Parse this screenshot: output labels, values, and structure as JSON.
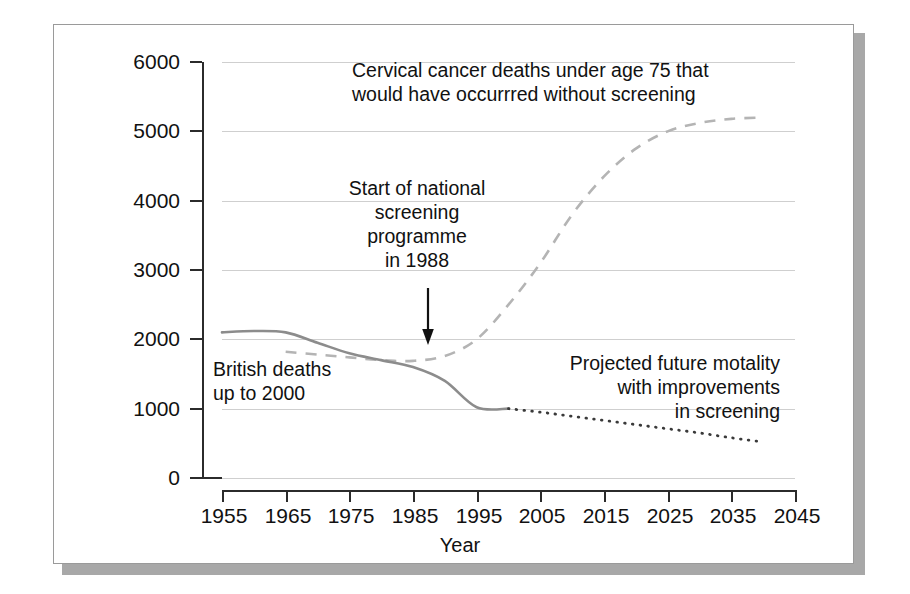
{
  "figure": {
    "background_color": "#ffffff",
    "frame_border_color": "#9a9a9a",
    "shadow_color": "#a8a8a8"
  },
  "chart_data": {
    "type": "line",
    "title": "",
    "xlabel": "Year",
    "ylabel": "Annual deaths",
    "xlim": [
      1955,
      2045
    ],
    "ylim": [
      0,
      6000
    ],
    "grid": true,
    "legend_position": "none",
    "x_ticks": [
      "1955",
      "1965",
      "1975",
      "1985",
      "1995",
      "2005",
      "2015",
      "2025",
      "2035",
      "2045"
    ],
    "y_ticks": [
      "0",
      "1000",
      "2000",
      "3000",
      "4000",
      "5000",
      "6000"
    ],
    "series": [
      {
        "name": "British deaths up to 2000",
        "style": "solid",
        "color": "#8c8c8c",
        "x": [
          1955,
          1960,
          1965,
          1970,
          1975,
          1980,
          1985,
          1990,
          1995,
          2000
        ],
        "values": [
          2100,
          2120,
          2100,
          1950,
          1800,
          1700,
          1600,
          1400,
          1020,
          1000
        ]
      },
      {
        "name": "Cervical cancer deaths under age 75 that would have occurrred without screening",
        "style": "dashed",
        "color": "#b4b4b4",
        "x": [
          1965,
          1970,
          1975,
          1980,
          1985,
          1990,
          1995,
          2000,
          2005,
          2010,
          2015,
          2020,
          2025,
          2030,
          2035,
          2040
        ],
        "values": [
          1820,
          1780,
          1740,
          1700,
          1690,
          1760,
          2000,
          2500,
          3100,
          3800,
          4350,
          4750,
          5000,
          5120,
          5180,
          5200
        ]
      },
      {
        "name": "Projected future motality with improvements in screening",
        "style": "dotted",
        "color": "#3a3a3a",
        "x": [
          2000,
          2005,
          2010,
          2015,
          2020,
          2025,
          2030,
          2035,
          2040
        ],
        "values": [
          1000,
          950,
          890,
          830,
          770,
          710,
          650,
          580,
          520
        ]
      }
    ],
    "annotations": [
      {
        "id": "headline",
        "text": "Cervical cancer deaths under age 75 that\nwould have occurrred without screening",
        "align": "left"
      },
      {
        "id": "screening-start",
        "text": "Start of national\nscreening\nprogramme\nin 1988",
        "align": "center",
        "marker": "down-arrow-at-1988"
      },
      {
        "id": "british-deaths",
        "text": "British deaths\nup to 2000",
        "align": "left"
      },
      {
        "id": "projected-future",
        "text": "Projected future motality\nwith improvements\nin screening",
        "align": "right"
      }
    ]
  },
  "axes": {
    "y_title": "Annual deaths",
    "x_title": "Year",
    "y_tick_labels": [
      "6000",
      "5000",
      "4000",
      "3000",
      "2000",
      "1000",
      "0"
    ],
    "x_tick_labels": [
      "1955",
      "1965",
      "1975",
      "1985",
      "1995",
      "2005",
      "2015",
      "2025",
      "2035",
      "2045"
    ]
  },
  "annotations": {
    "headline": "Cervical cancer deaths under age 75 that\nwould have occurrred without screening",
    "screening_start": "Start of national\nscreening\nprogramme\nin 1988",
    "british_deaths": "British deaths\nup to 2000",
    "projected_future": "Projected future motality\nwith improvements\nin screening"
  }
}
